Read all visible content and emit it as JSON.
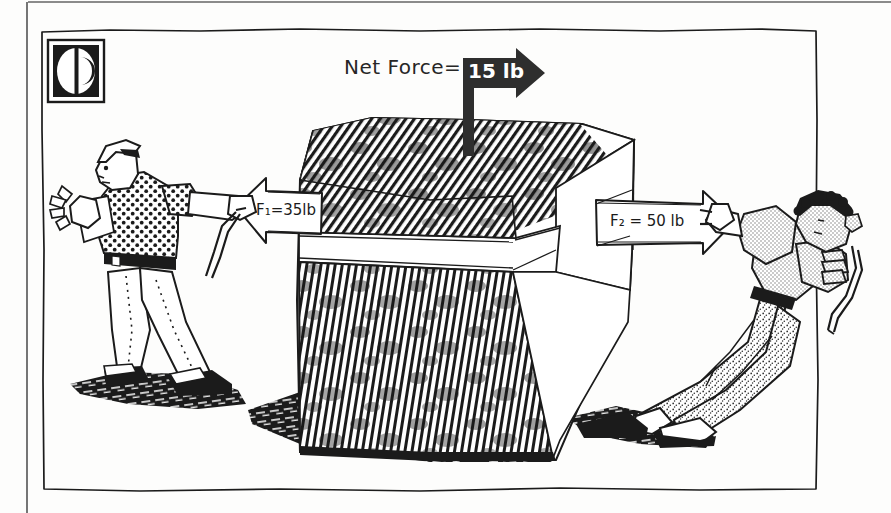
{
  "figure": {
    "caption_top_edge": "page-edge-line",
    "logo": {
      "name": "publisher-logo",
      "description": "black square mark with white crescent C"
    },
    "annotations": {
      "net_force_label": "Net Force=",
      "net_force_value": "15 lb",
      "force_left_label": "F₁=35lb",
      "force_right_label": "F₂ = 50 lb"
    },
    "objects": {
      "crate_name": "hatched-crate",
      "left_puller_name": "man-pulling-left",
      "right_puller_name": "man-pulling-right",
      "signpost_name": "net-force-signpost"
    },
    "colors": {
      "ink": "#1b1b1b",
      "paper": "#fdfdfc",
      "shade_light": "#d8d8d8",
      "shade_mid": "#9a9a9a"
    }
  },
  "physics": {
    "force_1_magnitude": 35,
    "force_1_unit": "lb",
    "force_1_direction": "left",
    "force_2_magnitude": 50,
    "force_2_unit": "lb",
    "force_2_direction": "right",
    "net_force_magnitude": 15,
    "net_force_unit": "lb",
    "net_force_direction": "right"
  }
}
